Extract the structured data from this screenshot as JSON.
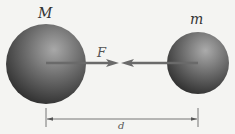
{
  "diagram": {
    "labels": {
      "large_mass": "M",
      "small_mass": "m",
      "force": "F",
      "distance": "d"
    },
    "colors": {
      "background": "#f4f4f2",
      "sphere_light": "#9a9a9a",
      "sphere_dark": "#2e2e2e",
      "force_arrow": "#6a6a6a",
      "dimension_line": "#555555"
    }
  }
}
